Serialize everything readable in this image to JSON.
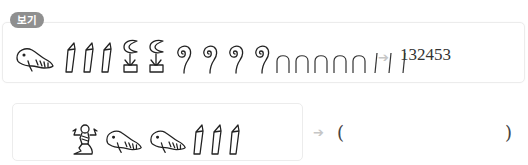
{
  "example": {
    "badge_label": "보기",
    "glyphs": [
      {
        "name": "tadpole-glyph",
        "value": 100000
      },
      {
        "name": "lotus-glyph",
        "value": 1000
      },
      {
        "name": "finger-glyph",
        "value": 10000
      },
      {
        "name": "coil-glyph",
        "value": 100
      },
      {
        "name": "heel-glyph",
        "value": 10
      },
      {
        "name": "stroke-glyph",
        "value": 1
      }
    ],
    "sequence": [
      "tadpole",
      "finger",
      "finger",
      "finger",
      "lotus",
      "lotus",
      "coil",
      "coil",
      "coil",
      "coil",
      "heel",
      "heel",
      "heel",
      "heel",
      "heel",
      "stroke",
      "stroke",
      "stroke"
    ],
    "arrow": "➔",
    "result": "132453"
  },
  "question": {
    "sequence": [
      "god",
      "tadpole",
      "tadpole",
      "finger",
      "finger",
      "finger"
    ],
    "arrow": "➔",
    "open_paren": "(",
    "close_paren": ")",
    "answer": ""
  },
  "colors": {
    "badge_bg": "#8f8f8f",
    "box_border": "#ececec",
    "arrow": "#c6c6c6",
    "ink": "#333333"
  }
}
